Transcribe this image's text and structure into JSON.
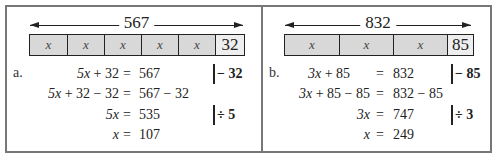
{
  "problems": [
    {
      "label": "a.",
      "total": "567",
      "bar": {
        "variable": "x",
        "variable_count": 5,
        "constant": "32"
      },
      "steps": [
        {
          "lhs": "5x + 32",
          "rhs": "567",
          "operation": "− 32"
        },
        {
          "lhs": "5x + 32 − 32",
          "rhs": "567 − 32",
          "operation": ""
        },
        {
          "lhs": "5x",
          "rhs": "535",
          "operation": "÷ 5"
        },
        {
          "lhs": "x",
          "rhs": "107",
          "operation": ""
        }
      ]
    },
    {
      "label": "b.",
      "total": "832",
      "bar": {
        "variable": "x",
        "variable_count": 3,
        "constant": "85"
      },
      "steps": [
        {
          "lhs": "3x + 85",
          "rhs": "832",
          "operation": "− 85"
        },
        {
          "lhs": "3x + 85 − 85",
          "rhs": "832 − 85",
          "operation": ""
        },
        {
          "lhs": "3x",
          "rhs": "747",
          "operation": "÷ 3"
        },
        {
          "lhs": "x",
          "rhs": "249",
          "operation": ""
        }
      ]
    }
  ],
  "symbols": {
    "equals": "="
  }
}
